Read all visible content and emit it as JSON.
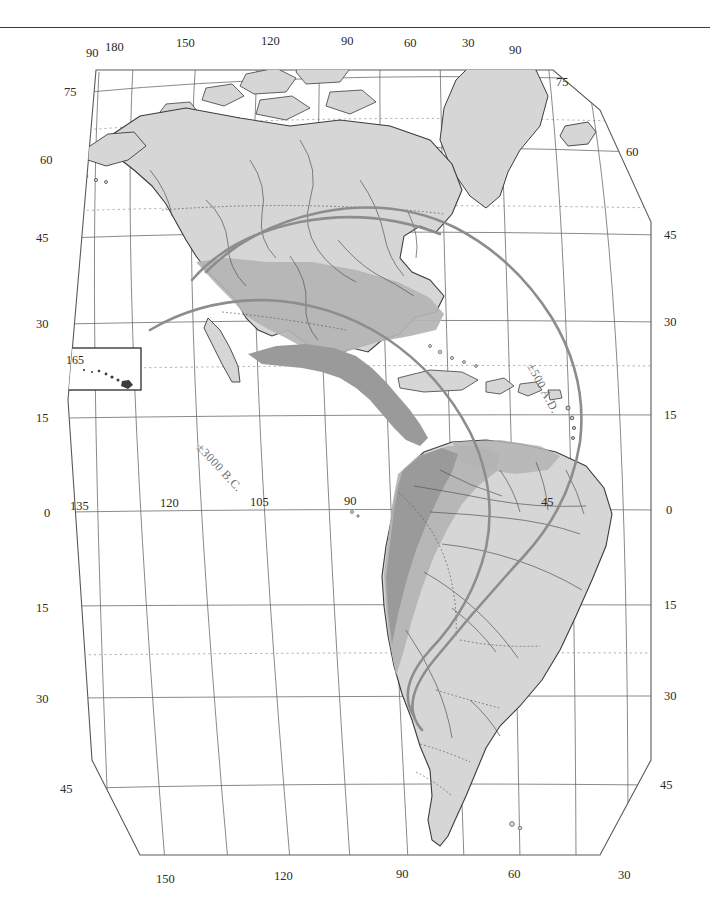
{
  "figure": {
    "kind": "map",
    "region": "The Americas",
    "projection": "curved-meridian pseudoconic",
    "has_top_rule": true
  },
  "colors": {
    "paper": "#ffffff",
    "land_light": "#d6d6d6",
    "land_medium": "#b4b4b4",
    "land_dark": "#9a9a9a",
    "coastline": "#3c3c3c",
    "graticule": "#6b6b6b",
    "graticule_dotted": "#9a9a9a",
    "contour": "#8d8d8d",
    "label": "#2a2a2a",
    "contour_label": "#6e6e6e",
    "rule": "#3a3a3a"
  },
  "legend_contours": [
    {
      "id": "c-500ad",
      "label": "±500 A.D.",
      "x": 527,
      "y": 366,
      "rotate": 62
    },
    {
      "id": "c-3000bc",
      "label": "±3000 B.C.",
      "x": 196,
      "y": 448,
      "rotate": 47
    }
  ],
  "graticule_labels": {
    "top": [
      {
        "text": "90",
        "x": 86,
        "y": 57
      },
      {
        "text": "180",
        "x": 113,
        "y": 51
      },
      {
        "text": "150",
        "x": 183,
        "y": 47
      },
      {
        "text": "120",
        "x": 268,
        "y": 45
      },
      {
        "text": "90",
        "x": 345,
        "y": 45
      },
      {
        "text": "60",
        "x": 408,
        "y": 47
      },
      {
        "text": "30",
        "x": 466,
        "y": 47
      },
      {
        "text": "90",
        "x": 513,
        "y": 54
      }
    ],
    "left": [
      {
        "text": "75",
        "x": 70,
        "y": 92
      },
      {
        "text": "60",
        "x": 44,
        "y": 160
      },
      {
        "text": "45",
        "x": 39,
        "y": 238
      },
      {
        "text": "30",
        "x": 39,
        "y": 324
      },
      {
        "text": "15",
        "x": 39,
        "y": 418
      },
      {
        "text": "0",
        "x": 44,
        "y": 513
      },
      {
        "text": "15",
        "x": 39,
        "y": 609
      },
      {
        "text": "30",
        "x": 39,
        "y": 700
      },
      {
        "text": "45",
        "x": 66,
        "y": 790
      }
    ],
    "right": [
      {
        "text": "75",
        "x": 560,
        "y": 82
      },
      {
        "text": "60",
        "x": 629,
        "y": 152
      },
      {
        "text": "45",
        "x": 668,
        "y": 235
      },
      {
        "text": "30",
        "x": 668,
        "y": 322
      },
      {
        "text": "15",
        "x": 668,
        "y": 415
      },
      {
        "text": "0",
        "x": 668,
        "y": 510
      },
      {
        "text": "15",
        "x": 668,
        "y": 605
      },
      {
        "text": "30",
        "x": 668,
        "y": 696
      },
      {
        "text": "45",
        "x": 664,
        "y": 785
      }
    ],
    "equator": [
      {
        "text": "135",
        "x": 78,
        "y": 506
      },
      {
        "text": "120",
        "x": 168,
        "y": 503
      },
      {
        "text": "105",
        "x": 258,
        "y": 502
      },
      {
        "text": "90",
        "x": 348,
        "y": 501
      },
      {
        "text": "45",
        "x": 545,
        "y": 502
      }
    ],
    "bottom": [
      {
        "text": "150",
        "x": 162,
        "y": 879
      },
      {
        "text": "120",
        "x": 280,
        "y": 876
      },
      {
        "text": "90",
        "x": 400,
        "y": 874
      },
      {
        "text": "60",
        "x": 512,
        "y": 874
      },
      {
        "text": "30",
        "x": 622,
        "y": 875
      }
    ]
  },
  "inset": {
    "name": "hawaii-inset",
    "label": "165",
    "box": {
      "x": 58,
      "y": 348,
      "w": 83,
      "h": 42
    }
  },
  "shading_legend": [
    {
      "tone": "light",
      "meaning": "land"
    },
    {
      "tone": "medium",
      "meaning": "agricultural / intermediate area"
    },
    {
      "tone": "dark",
      "meaning": "core nuclear area (Mesoamerica / Andes)"
    }
  ]
}
